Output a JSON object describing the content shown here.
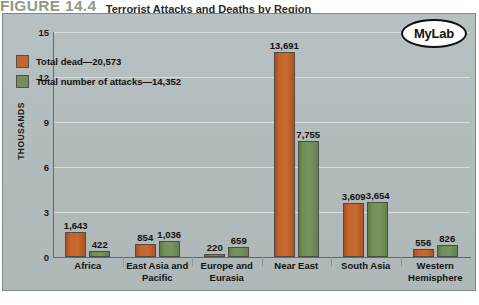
{
  "figure": {
    "number": "FIGURE 14.4",
    "title": "Terrorist Attacks and Deaths by Region"
  },
  "badge": {
    "label": "MyLab"
  },
  "colors": {
    "dead": "#c4632a",
    "attacks": "#729058",
    "panel_background": "#b2bcbd",
    "gridline": "#d7dedf",
    "axis": "#5f6b6d",
    "text": "#14110f"
  },
  "chart_data": {
    "type": "bar",
    "title": "Terrorist Attacks and Deaths by Region",
    "xlabel": "",
    "ylabel": "THOUSANDS",
    "ylim": [
      0,
      15
    ],
    "yticks": [
      0,
      3,
      6,
      9,
      12,
      15
    ],
    "ytick_labels": [
      "0",
      "3",
      "6",
      "9",
      "12",
      "15"
    ],
    "grid": true,
    "legend_position": "upper-left-inside",
    "categories": [
      "Africa",
      "East Asia and Pacific",
      "Europe and Eurasia",
      "Near East",
      "South Asia",
      "Western Hemisphere"
    ],
    "category_lines": [
      [
        "Africa"
      ],
      [
        "East Asia and",
        "Pacific"
      ],
      [
        "Europe and",
        "Eurasia"
      ],
      [
        "Near East"
      ],
      [
        "South Asia"
      ],
      [
        "Western",
        "Hemisphere"
      ]
    ],
    "series": [
      {
        "name": "Total dead—20,573",
        "short_name": "Total dead",
        "total": 20573,
        "color": "#c4632a",
        "values": [
          1643,
          854,
          220,
          13691,
          3609,
          556
        ],
        "value_labels": [
          "1,643",
          "854",
          "220",
          "13,691",
          "3,609",
          "556"
        ]
      },
      {
        "name": "Total number of attacks—14,352",
        "short_name": "Total number of attacks",
        "total": 14352,
        "color": "#729058",
        "values": [
          422,
          1036,
          659,
          7755,
          3654,
          826
        ],
        "value_labels": [
          "422",
          "1,036",
          "659",
          "7,755",
          "3,654",
          "826"
        ]
      }
    ]
  }
}
